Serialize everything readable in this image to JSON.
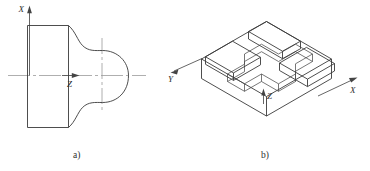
{
  "figure": {
    "title_a_caption": "a)",
    "title_b_caption": "b)",
    "panels": [
      {
        "id": "panel-a",
        "caption": "a)",
        "description": "Front view of a turned part: rectangular shank with a spherical/bulb head profile, with X vertical axis and Z horizontal axis.",
        "axes": [
          {
            "name": "X",
            "label": "X",
            "direction": "up"
          },
          {
            "name": "Z",
            "label": "Z",
            "direction": "right"
          }
        ],
        "centerlines": [
          "horizontal",
          "vertical"
        ]
      },
      {
        "id": "panel-b",
        "caption": "b)",
        "description": "Isometric pictorial of a rectangular block with a cross-shaped (plus-shaped) through slot machined in its top face.",
        "axes": [
          {
            "name": "Y",
            "label": "Y",
            "direction": "down-left"
          },
          {
            "name": "Z",
            "label": "Z",
            "direction": "up"
          },
          {
            "name": "X",
            "label": "X",
            "direction": "up-right"
          }
        ]
      }
    ],
    "colors": {
      "outline": "#3a3a3a",
      "centerline": "#9a9a9a",
      "axis": "#555555",
      "text": "#2e2e2e",
      "background": "#ffffff"
    }
  }
}
